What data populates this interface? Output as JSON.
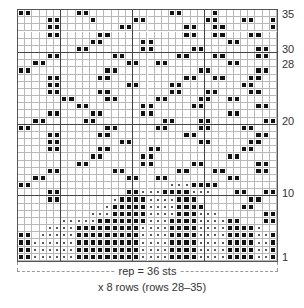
{
  "chart": {
    "columns": 36,
    "rows": 35,
    "major_col_lines": [
      6,
      16,
      26
    ],
    "major_row_lines_after_row": [
      30,
      20,
      10
    ],
    "legend_symbols": {
      ".": "empty",
      "X": "filled-square",
      "o": "dot"
    },
    "grid_rows_top_to_bottom": [
      "XX......XX...........XX....X........",
      "....XX....X.....XX........XX...XX..X",
      "....XX........XX.......XX..XX......X",
      "....XX.....XX..........XX..XX...XX..",
      "..........XX.....XX..........XX.....",
      "........XX.......XX.....XX.......XX.",
      "....XX.......XX.......XX...XX....XX.",
      "..XX...........XX..XX........XX.....",
      "XX..........XX...........XX......XX.",
      "....XX.....XX..........XX..XX...XX..",
      "....XX.........XX....XX........XX...",
      "....XX.....XX........XX...XX....XX..",
      "......XX....XX.....XX....XX..XX.....",
      "........XX.......XX.....XX.......XX.",
      "....XX....XX.....XX..........XX.....",
      "..XX.....XX.........XX...XX.......XX",
      "XX..........XX.....XX....XX....XX...",
      "....XX.....XX..........XX........XX.",
      "....XX........XX.........XX.....XX..",
      "....XX.....XX.....XX...........XX...",
      "..........XX.....XX..........XX.....",
      "........XX.......XX.....XX.......XX.",
      "....XX.......XX.......XX...XX....XX.",
      "..XX...........XX..XX........XX.....",
      "XX...................oooXXXX........",
      "....XX.........XXoooXXXXooo...XX..XX",
      "....XX.......oXXXXooooXXX.......XX..",
      "............oXXXXXooooXXXX.....XX...",
      "..........oooXXXXXooooXXXooo......XX",
      "......oooooXXXXXXXoooXXXXooooXX...XX",
      "....ooooXXXXXXXXXooooXXXXooooXXXXo..",
      "XX.oooooXXXXXXXXXooooXXXXooooXXXXooX",
      "XXooooooXXXXXXXXXooooXXXXooooXXXXooX",
      "XXooooooXXXXXXXXXooooXXXXooooXXXXooX",
      "XXooooooXXXXXXXXXooooXXXXooooXXXXooX"
    ]
  },
  "row_labels": [
    {
      "text": "35",
      "row": 35
    },
    {
      "text": "30",
      "row": 30
    },
    {
      "text": "28",
      "row": 28
    },
    {
      "text": "20",
      "row": 20
    },
    {
      "text": "10",
      "row": 10
    },
    {
      "text": "1",
      "row": 1
    }
  ],
  "footer": {
    "repeat_label": "rep = 36 sts",
    "rows_label": "x 8 rows (rows 28–35)"
  }
}
